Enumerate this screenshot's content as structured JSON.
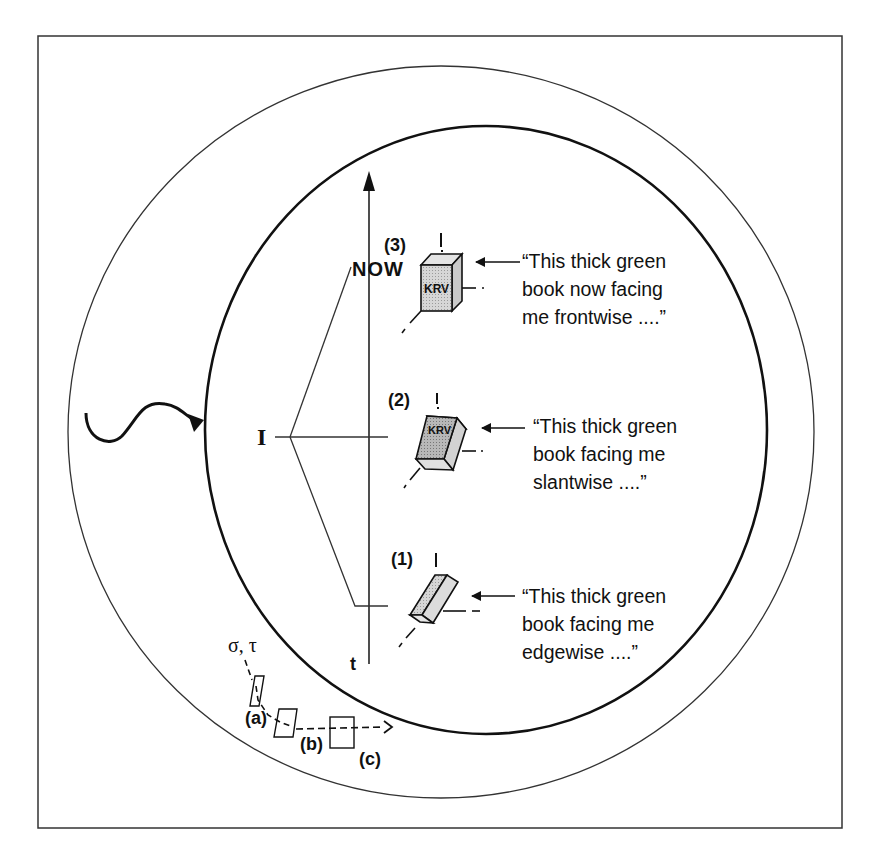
{
  "diagram": {
    "axis": {
      "time_label": "t",
      "now_label": "NOW"
    },
    "subject_label": "I",
    "stimulus_labels": [
      "σ, τ"
    ],
    "stages": [
      {
        "number_label": "(1)",
        "book_text": "",
        "orientation": "edgewise",
        "quote_lines": [
          "“This thick green",
          "book facing me",
          "edgewise ....”"
        ]
      },
      {
        "number_label": "(2)",
        "book_text": "KRV",
        "orientation": "slantwise",
        "quote_lines": [
          "“This thick green",
          "book facing me",
          "slantwise ....”"
        ]
      },
      {
        "number_label": "(3)",
        "book_text": "KRV",
        "orientation": "frontwise",
        "quote_lines": [
          "“This thick green",
          "book now facing",
          "me frontwise ....”"
        ]
      }
    ],
    "object_positions": [
      {
        "label": "(a)"
      },
      {
        "label": "(b)"
      },
      {
        "label": "(c)"
      }
    ],
    "stimulus_label": "σ, τ"
  }
}
